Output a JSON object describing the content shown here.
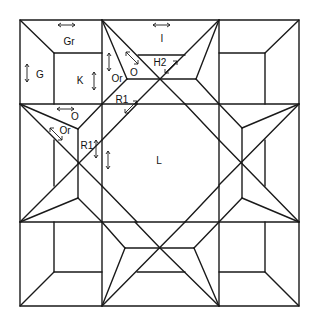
{
  "diagram": {
    "stroke_color": "#1a1a1a",
    "background": "#ffffff",
    "labels": [
      {
        "id": "gr",
        "text": "Gr",
        "x": 69,
        "y": 42
      },
      {
        "id": "g",
        "text": "G",
        "x": 40,
        "y": 75
      },
      {
        "id": "k",
        "text": "K",
        "x": 80,
        "y": 81
      },
      {
        "id": "or-top",
        "text": "Or",
        "x": 117,
        "y": 79
      },
      {
        "id": "o-top",
        "text": "O",
        "x": 134,
        "y": 73
      },
      {
        "id": "i",
        "text": "I",
        "x": 162,
        "y": 39
      },
      {
        "id": "h2",
        "text": "H2",
        "x": 160,
        "y": 63
      },
      {
        "id": "r1-top",
        "text": "R1",
        "x": 122,
        "y": 100
      },
      {
        "id": "o-left",
        "text": "O",
        "x": 75,
        "y": 117
      },
      {
        "id": "or-left",
        "text": "Or",
        "x": 65,
        "y": 131
      },
      {
        "id": "r1-left",
        "text": "R1",
        "x": 87,
        "y": 146
      },
      {
        "id": "l",
        "text": "L",
        "x": 159,
        "y": 161
      }
    ]
  }
}
